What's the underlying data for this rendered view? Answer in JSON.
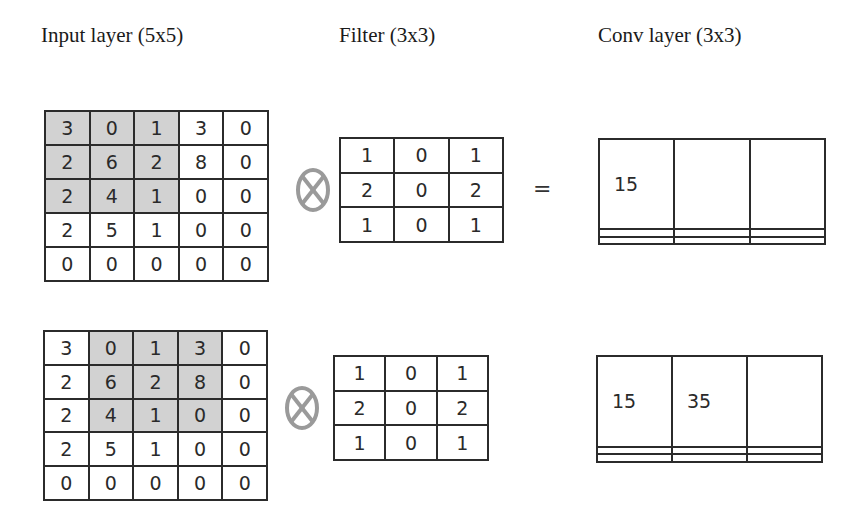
{
  "titles": {
    "input": "Input layer (5x5)",
    "filter": "Filter (3x3)",
    "conv": "Conv layer (3x3)"
  },
  "operators": {
    "convolve_icon": "circled-times-icon",
    "equals": "="
  },
  "colors": {
    "highlight": "#d2d2d2",
    "border": "#2b2b2b",
    "operator": "#9a9a9a"
  },
  "step1": {
    "input": [
      [
        "3",
        "0",
        "1",
        "3",
        "0"
      ],
      [
        "2",
        "6",
        "2",
        "8",
        "0"
      ],
      [
        "2",
        "4",
        "1",
        "0",
        "0"
      ],
      [
        "2",
        "5",
        "1",
        "0",
        "0"
      ],
      [
        "0",
        "0",
        "0",
        "0",
        "0"
      ]
    ],
    "highlight_cols": [
      0,
      1,
      2
    ],
    "highlight_rows": [
      0,
      1,
      2
    ],
    "filter": [
      [
        "1",
        "0",
        "1"
      ],
      [
        "2",
        "0",
        "2"
      ],
      [
        "1",
        "0",
        "1"
      ]
    ],
    "conv": [
      [
        "15",
        "",
        ""
      ],
      [
        "",
        "",
        ""
      ],
      [
        "",
        "",
        ""
      ]
    ]
  },
  "step2": {
    "input": [
      [
        "3",
        "0",
        "1",
        "3",
        "0"
      ],
      [
        "2",
        "6",
        "2",
        "8",
        "0"
      ],
      [
        "2",
        "4",
        "1",
        "0",
        "0"
      ],
      [
        "2",
        "5",
        "1",
        "0",
        "0"
      ],
      [
        "0",
        "0",
        "0",
        "0",
        "0"
      ]
    ],
    "highlight_cols": [
      1,
      2,
      3
    ],
    "highlight_rows": [
      0,
      1,
      2
    ],
    "filter": [
      [
        "1",
        "0",
        "1"
      ],
      [
        "2",
        "0",
        "2"
      ],
      [
        "1",
        "0",
        "1"
      ]
    ],
    "conv": [
      [
        "15",
        "35",
        ""
      ],
      [
        "",
        "",
        ""
      ],
      [
        "",
        "",
        ""
      ]
    ]
  }
}
